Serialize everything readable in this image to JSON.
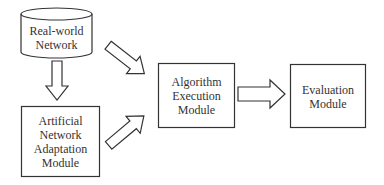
{
  "diagram": {
    "nodes": [
      {
        "id": "real_world_network",
        "shape": "cylinder",
        "lines": [
          "Real-world",
          "Network"
        ]
      },
      {
        "id": "artificial_network_adaptation",
        "shape": "rectangle",
        "lines": [
          "Artificial",
          "Network",
          "Adaptation",
          "Module"
        ]
      },
      {
        "id": "algorithm_execution",
        "shape": "rectangle",
        "lines": [
          "Algorithm",
          "Execution",
          "Module"
        ]
      },
      {
        "id": "evaluation",
        "shape": "rectangle",
        "lines": [
          "Evaluation",
          "Module"
        ]
      }
    ],
    "edges": [
      {
        "from": "real_world_network",
        "to": "artificial_network_adaptation",
        "style": "hollow-block-arrow",
        "direction": "down"
      },
      {
        "from": "real_world_network",
        "to": "algorithm_execution",
        "style": "hollow-block-arrow",
        "direction": "down-right"
      },
      {
        "from": "artificial_network_adaptation",
        "to": "algorithm_execution",
        "style": "hollow-block-arrow",
        "direction": "up-right"
      },
      {
        "from": "algorithm_execution",
        "to": "evaluation",
        "style": "hollow-block-arrow",
        "direction": "right"
      }
    ],
    "colors": {
      "stroke": "#333333",
      "fill": "#ffffff",
      "text": "#333333"
    }
  }
}
